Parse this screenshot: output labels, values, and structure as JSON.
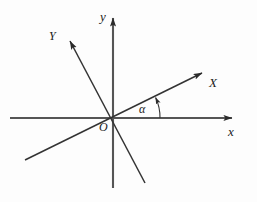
{
  "figure": {
    "type": "coordinate-axes-diagram",
    "background_color": "#fdfdfd",
    "line_color": "#333333",
    "axis_color": "#4a4a4a",
    "text_color": "#1a1a1a"
  },
  "labels": {
    "y_axis": "y",
    "Y_axis": "Y",
    "X_axis": "X",
    "x_axis": "x",
    "origin": "O",
    "angle": "α"
  },
  "geometry": {
    "origin": {
      "x": 113,
      "y": 118
    },
    "x_axis": {
      "start": {
        "x": 10,
        "y": 118
      },
      "end": {
        "x": 236,
        "y": 118
      },
      "arrow": "end"
    },
    "y_axis": {
      "start": {
        "x": 113,
        "y": 188
      },
      "end": {
        "x": 113,
        "y": 13
      },
      "arrow": "end"
    },
    "X_axis": {
      "start": {
        "x": 25,
        "y": 160
      },
      "end": {
        "x": 206,
        "y": 71
      },
      "arrow": "end"
    },
    "Y_axis": {
      "start": {
        "x": 145,
        "y": 183
      },
      "end": {
        "x": 67,
        "y": 36
      },
      "arrow": "end"
    },
    "angle_arc": {
      "radius": 47,
      "from_degrees": 0,
      "to_degrees": 26,
      "arrow": "end"
    }
  }
}
